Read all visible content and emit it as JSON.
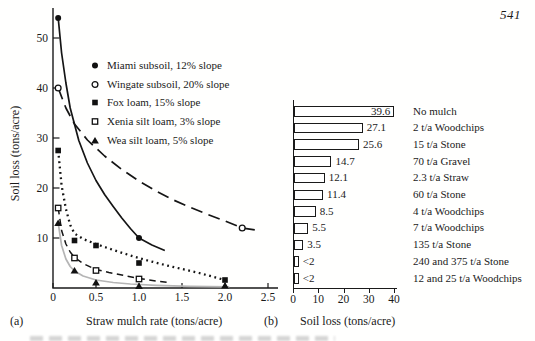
{
  "page": {
    "number": "541"
  },
  "panel_a": {
    "tag": "(a)",
    "xlabel": "Straw mulch rate (tons/acre)",
    "ylabel": "Soil loss (tons/acre)"
  },
  "panel_b": {
    "tag": "(b)",
    "xlabel": "Soil loss (tons/acre)"
  },
  "chart_data": [
    {
      "type": "line",
      "panel": "a",
      "xlabel": "Straw mulch rate (tons/acre)",
      "ylabel": "Soil loss (tons/acre)",
      "xlim": [
        0,
        2.5
      ],
      "ylim": [
        0,
        56
      ],
      "xticks": [
        "0",
        "0.5",
        "1.0",
        "1.5",
        "2.0",
        "2.5"
      ],
      "yticks": [
        "10",
        "20",
        "30",
        "40",
        "50"
      ],
      "grid": false,
      "legend_position": "upper-right-inside",
      "series": [
        {
          "name": "Miami subsoil, 12% slope",
          "marker": "filled-circle",
          "line": "solid",
          "color": "#151515",
          "points": [
            [
              0.06,
              54
            ],
            [
              1.0,
              10
            ]
          ],
          "curve": [
            [
              0.06,
              54
            ],
            [
              0.1,
              47
            ],
            [
              0.15,
              41
            ],
            [
              0.2,
              36
            ],
            [
              0.3,
              29.5
            ],
            [
              0.4,
              25
            ],
            [
              0.5,
              21.5
            ],
            [
              0.6,
              18.7
            ],
            [
              0.7,
              16.3
            ],
            [
              0.8,
              14
            ],
            [
              0.9,
              11.9
            ],
            [
              1.0,
              10
            ],
            [
              1.15,
              8.6
            ],
            [
              1.3,
              7.5
            ]
          ]
        },
        {
          "name": "Wingate subsoil, 20% slope",
          "marker": "open-circle",
          "line": "long-dash",
          "color": "#151515",
          "points": [
            [
              0.06,
              40
            ],
            [
              2.2,
              12
            ]
          ],
          "curve": [
            [
              0.06,
              40
            ],
            [
              0.15,
              36
            ],
            [
              0.25,
              32.8
            ],
            [
              0.4,
              29.6
            ],
            [
              0.6,
              26.4
            ],
            [
              0.8,
              23.7
            ],
            [
              1.0,
              21.4
            ],
            [
              1.2,
              19.4
            ],
            [
              1.4,
              17.6
            ],
            [
              1.6,
              16.1
            ],
            [
              1.8,
              14.7
            ],
            [
              2.0,
              13.4
            ],
            [
              2.2,
              12
            ],
            [
              2.4,
              11.5
            ]
          ]
        },
        {
          "name": "Fox loam, 15% slope",
          "marker": "filled-square",
          "line": "dotted",
          "color": "#151515",
          "points": [
            [
              0.06,
              27.5
            ],
            [
              0.25,
              9.5
            ],
            [
              0.5,
              8.5
            ],
            [
              1.0,
              5
            ],
            [
              2.0,
              1.6
            ]
          ],
          "curve": [
            [
              0.06,
              27.5
            ],
            [
              0.1,
              20.5
            ],
            [
              0.15,
              15.8
            ],
            [
              0.2,
              12.6
            ],
            [
              0.25,
              10.9
            ],
            [
              0.35,
              9.8
            ],
            [
              0.5,
              8.8
            ],
            [
              0.7,
              7.6
            ],
            [
              0.9,
              6.5
            ],
            [
              1.1,
              5.5
            ],
            [
              1.3,
              4.6
            ],
            [
              1.5,
              3.8
            ],
            [
              1.7,
              3.0
            ],
            [
              1.85,
              2.3
            ],
            [
              2.0,
              1.6
            ]
          ]
        },
        {
          "name": "Xenia silt loam, 3% slope",
          "marker": "open-square",
          "line": "dash",
          "color": "#151515",
          "points": [
            [
              0.06,
              16
            ],
            [
              0.25,
              6
            ],
            [
              0.5,
              3.5
            ],
            [
              1.0,
              1.8
            ]
          ],
          "curve": [
            [
              0.06,
              16
            ],
            [
              0.1,
              11.5
            ],
            [
              0.15,
              8.8
            ],
            [
              0.2,
              7.2
            ],
            [
              0.25,
              6.1
            ],
            [
              0.35,
              4.9
            ],
            [
              0.5,
              3.7
            ],
            [
              0.65,
              3.1
            ],
            [
              0.8,
              2.6
            ],
            [
              1.0,
              1.9
            ],
            [
              1.2,
              1.4
            ],
            [
              1.35,
              1.1
            ]
          ]
        },
        {
          "name": "Wea silt loam, 5% slope",
          "marker": "filled-triangle",
          "line": "solid",
          "color": "#b5b5b5",
          "points": [
            [
              0.06,
              13
            ],
            [
              0.25,
              3.5
            ],
            [
              0.5,
              1.1
            ],
            [
              1.0,
              0.4
            ],
            [
              2.0,
              0.5
            ]
          ],
          "curve": [
            [
              0.06,
              13
            ],
            [
              0.1,
              8.5
            ],
            [
              0.15,
              5.8
            ],
            [
              0.2,
              4.3
            ],
            [
              0.25,
              3.4
            ],
            [
              0.35,
              2.4
            ],
            [
              0.5,
              1.6
            ],
            [
              0.7,
              1.1
            ],
            [
              0.9,
              0.8
            ],
            [
              1.2,
              0.55
            ],
            [
              1.6,
              0.35
            ],
            [
              2.05,
              0.25
            ]
          ]
        }
      ]
    },
    {
      "type": "bar",
      "panel": "b",
      "orientation": "horizontal",
      "xlabel": "Soil loss (tons/acre)",
      "xlim": [
        0,
        40
      ],
      "xticks": [
        "0",
        "10",
        "20",
        "30",
        "40"
      ],
      "bars": [
        {
          "label": "No mulch",
          "value": 39.6,
          "display": "39.6"
        },
        {
          "label": "2 t/a Woodchips",
          "value": 27.1,
          "display": "27.1"
        },
        {
          "label": "15 t/a Stone",
          "value": 25.6,
          "display": "25.6"
        },
        {
          "label": "70 t/a Gravel",
          "value": 14.7,
          "display": "14.7"
        },
        {
          "label": "2.3 t/a Straw",
          "value": 12.1,
          "display": "12.1"
        },
        {
          "label": "60 t/a Stone",
          "value": 11.4,
          "display": "11.4"
        },
        {
          "label": "4 t/a Woodchips",
          "value": 8.5,
          "display": "8.5"
        },
        {
          "label": "7 t/a Woodchips",
          "value": 5.5,
          "display": "5.5"
        },
        {
          "label": "135 t/a Stone",
          "value": 3.5,
          "display": "3.5"
        },
        {
          "label": "240 and 375 t/a Stone",
          "value": 1.8,
          "display": "<2"
        },
        {
          "label": "12 and 25 t/a Woodchips",
          "value": 1.8,
          "display": "<2"
        }
      ]
    }
  ]
}
